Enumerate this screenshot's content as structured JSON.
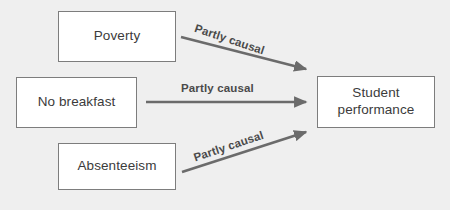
{
  "diagram": {
    "background_color": "#efefef",
    "node_fill_color": "#ffffff",
    "node_border_color": "#7d7d7d",
    "node_text_color": "#3b3b3b",
    "arrow_color": "#6b6b6b",
    "label_text_color": "#4a4a4a",
    "nodes": [
      {
        "id": "poverty",
        "label": "Poverty"
      },
      {
        "id": "no_breakfast",
        "label": "No breakfast"
      },
      {
        "id": "absenteeism",
        "label": "Absenteeism"
      },
      {
        "id": "student_performance",
        "label_line1": "Student",
        "label_line2": "performance"
      }
    ],
    "edges": [
      {
        "id": "poverty_to_performance",
        "from": "Poverty",
        "to": "Student performance",
        "label": "Partly causal"
      },
      {
        "id": "no_breakfast_to_performance",
        "from": "No breakfast",
        "to": "Student performance",
        "label": "Partly causal"
      },
      {
        "id": "absenteeism_to_performance",
        "from": "Absenteeism",
        "to": "Student performance",
        "label": "Partly causal"
      }
    ]
  }
}
